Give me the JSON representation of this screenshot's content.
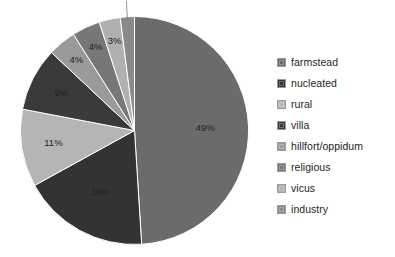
{
  "chart_data": {
    "type": "pie",
    "title": "",
    "subtitle": "",
    "xlabel": "",
    "ylabel": "",
    "grid": false,
    "legend_position": "right",
    "background_color": "#ffffff",
    "label_format": "percent",
    "start_angle_deg": 0,
    "direction": "clockwise",
    "categories": [
      "farmstead",
      "nucleated",
      "rural",
      "villa",
      "hillfort/oppidum",
      "religious",
      "vicus",
      "industry"
    ],
    "values": [
      49,
      18,
      11,
      9,
      4,
      4,
      3,
      2
    ],
    "value_labels": [
      "49%",
      "18%",
      "11%",
      "9%",
      "4%",
      "4%",
      "3%",
      "2%"
    ],
    "colors": [
      "#6b6b6b",
      "#333333",
      "#b5b5b5",
      "#3a3a3a",
      "#9a9a9a",
      "#777777",
      "#b0b0b0",
      "#8a8a8a"
    ],
    "slice_border_color": "#ffffff",
    "label_color": "#231f20",
    "slices": [
      {
        "label": "farmstead",
        "value": 49,
        "display": "49%",
        "color": "#6b6b6b",
        "label_placement": "inside"
      },
      {
        "label": "nucleated",
        "value": 18,
        "display": "18%",
        "color": "#333333",
        "label_placement": "inside"
      },
      {
        "label": "rural",
        "value": 11,
        "display": "11%",
        "color": "#b5b5b5",
        "label_placement": "inside"
      },
      {
        "label": "villa",
        "value": 9,
        "display": "9%",
        "color": "#3a3a3a",
        "label_placement": "inside"
      },
      {
        "label": "hillfort/oppidum",
        "value": 4,
        "display": "4%",
        "color": "#9a9a9a",
        "label_placement": "inside"
      },
      {
        "label": "religious",
        "value": 4,
        "display": "4%",
        "color": "#777777",
        "label_placement": "inside"
      },
      {
        "label": "vicus",
        "value": 3,
        "display": "3%",
        "color": "#b0b0b0",
        "label_placement": "inside"
      },
      {
        "label": "industry",
        "value": 2,
        "display": "2%",
        "color": "#8a8a8a",
        "label_placement": "outside"
      }
    ]
  },
  "legend": {
    "items": [
      {
        "label": "farmstead",
        "color": "#6b6b6b"
      },
      {
        "label": "nucleated",
        "color": "#333333"
      },
      {
        "label": "rural",
        "color": "#b5b5b5"
      },
      {
        "label": "villa",
        "color": "#3a3a3a"
      },
      {
        "label": "hillfort/oppidum",
        "color": "#9a9a9a"
      },
      {
        "label": "religious",
        "color": "#777777"
      },
      {
        "label": "vicus",
        "color": "#b0b0b0"
      },
      {
        "label": "industry",
        "color": "#8a8a8a"
      }
    ]
  }
}
